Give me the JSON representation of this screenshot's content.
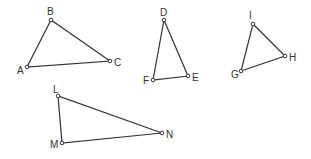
{
  "diagram": {
    "background": "#ffffff",
    "stroke_color": "#333333",
    "triangles": [
      {
        "name": "ABC",
        "vertices": [
          {
            "label": "A",
            "x": 27,
            "y": 67,
            "lx": 17,
            "ly": 74
          },
          {
            "label": "B",
            "x": 51,
            "y": 20,
            "lx": 47,
            "ly": 15
          },
          {
            "label": "C",
            "x": 110,
            "y": 61,
            "lx": 114,
            "ly": 66
          }
        ]
      },
      {
        "name": "DEF",
        "vertices": [
          {
            "label": "D",
            "x": 164,
            "y": 20,
            "lx": 160,
            "ly": 16
          },
          {
            "label": "E",
            "x": 188,
            "y": 76,
            "lx": 192,
            "ly": 81
          },
          {
            "label": "F",
            "x": 153,
            "y": 80,
            "lx": 143,
            "ly": 84
          }
        ]
      },
      {
        "name": "GHI",
        "vertices": [
          {
            "label": "G",
            "x": 241,
            "y": 71,
            "lx": 231,
            "ly": 78
          },
          {
            "label": "H",
            "x": 285,
            "y": 56,
            "lx": 289,
            "ly": 61
          },
          {
            "label": "I",
            "x": 253,
            "y": 24,
            "lx": 249,
            "ly": 19
          }
        ]
      },
      {
        "name": "LMN",
        "vertices": [
          {
            "label": "L",
            "x": 58,
            "y": 96,
            "lx": 53,
            "ly": 93
          },
          {
            "label": "M",
            "x": 62,
            "y": 143,
            "lx": 50,
            "ly": 148
          },
          {
            "label": "N",
            "x": 162,
            "y": 133,
            "lx": 166,
            "ly": 138
          }
        ]
      }
    ]
  }
}
